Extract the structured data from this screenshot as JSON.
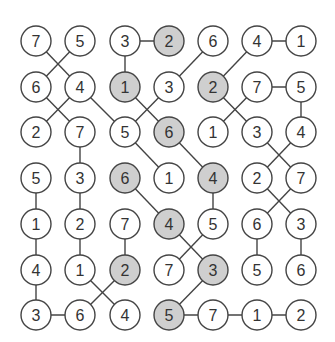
{
  "puzzle": {
    "cols": 7,
    "rows": 7,
    "colX": [
      36,
      80,
      125,
      169,
      213,
      257,
      301
    ],
    "rowY": [
      41,
      87,
      132,
      178,
      224,
      270,
      315
    ],
    "radius": 15,
    "colors": {
      "stroke": "#444444",
      "fill": "#ffffff",
      "shaded": "#cfcfcf",
      "text": "#333333"
    },
    "values": [
      [
        7,
        5,
        3,
        2,
        6,
        4,
        1
      ],
      [
        6,
        4,
        1,
        3,
        2,
        7,
        5
      ],
      [
        2,
        7,
        5,
        6,
        1,
        3,
        4
      ],
      [
        5,
        3,
        6,
        1,
        4,
        2,
        7
      ],
      [
        1,
        2,
        7,
        4,
        5,
        6,
        3
      ],
      [
        4,
        1,
        2,
        7,
        3,
        5,
        6
      ],
      [
        3,
        6,
        4,
        5,
        7,
        1,
        2
      ]
    ],
    "shaded": [
      [
        0,
        3
      ],
      [
        1,
        2
      ],
      [
        1,
        4
      ],
      [
        2,
        3
      ],
      [
        3,
        2
      ],
      [
        3,
        4
      ],
      [
        4,
        3
      ],
      [
        5,
        2
      ],
      [
        5,
        4
      ],
      [
        6,
        3
      ]
    ],
    "edges": [
      [
        [
          0,
          0
        ],
        [
          1,
          1
        ]
      ],
      [
        [
          0,
          1
        ],
        [
          1,
          0
        ]
      ],
      [
        [
          0,
          2
        ],
        [
          0,
          3
        ]
      ],
      [
        [
          0,
          2
        ],
        [
          1,
          2
        ]
      ],
      [
        [
          0,
          4
        ],
        [
          1,
          3
        ]
      ],
      [
        [
          0,
          5
        ],
        [
          1,
          4
        ]
      ],
      [
        [
          0,
          5
        ],
        [
          0,
          6
        ]
      ],
      [
        [
          1,
          0
        ],
        [
          2,
          1
        ]
      ],
      [
        [
          1,
          1
        ],
        [
          2,
          0
        ]
      ],
      [
        [
          1,
          1
        ],
        [
          2,
          2
        ]
      ],
      [
        [
          1,
          2
        ],
        [
          2,
          3
        ]
      ],
      [
        [
          1,
          3
        ],
        [
          2,
          2
        ]
      ],
      [
        [
          1,
          4
        ],
        [
          2,
          5
        ]
      ],
      [
        [
          1,
          5
        ],
        [
          2,
          4
        ]
      ],
      [
        [
          1,
          5
        ],
        [
          1,
          6
        ]
      ],
      [
        [
          1,
          6
        ],
        [
          2,
          6
        ]
      ],
      [
        [
          2,
          1
        ],
        [
          3,
          1
        ]
      ],
      [
        [
          2,
          2
        ],
        [
          3,
          3
        ]
      ],
      [
        [
          2,
          3
        ],
        [
          3,
          4
        ]
      ],
      [
        [
          2,
          5
        ],
        [
          3,
          6
        ]
      ],
      [
        [
          2,
          6
        ],
        [
          3,
          5
        ]
      ],
      [
        [
          3,
          0
        ],
        [
          4,
          0
        ]
      ],
      [
        [
          3,
          1
        ],
        [
          4,
          1
        ]
      ],
      [
        [
          3,
          2
        ],
        [
          4,
          3
        ]
      ],
      [
        [
          3,
          4
        ],
        [
          4,
          4
        ]
      ],
      [
        [
          3,
          5
        ],
        [
          4,
          6
        ]
      ],
      [
        [
          3,
          6
        ],
        [
          4,
          5
        ]
      ],
      [
        [
          4,
          0
        ],
        [
          5,
          0
        ]
      ],
      [
        [
          4,
          1
        ],
        [
          5,
          1
        ]
      ],
      [
        [
          4,
          2
        ],
        [
          5,
          2
        ]
      ],
      [
        [
          4,
          3
        ],
        [
          5,
          4
        ]
      ],
      [
        [
          4,
          4
        ],
        [
          5,
          3
        ]
      ],
      [
        [
          4,
          5
        ],
        [
          5,
          5
        ]
      ],
      [
        [
          4,
          6
        ],
        [
          5,
          6
        ]
      ],
      [
        [
          5,
          0
        ],
        [
          6,
          0
        ]
      ],
      [
        [
          5,
          1
        ],
        [
          6,
          2
        ]
      ],
      [
        [
          5,
          2
        ],
        [
          6,
          1
        ]
      ],
      [
        [
          5,
          4
        ],
        [
          6,
          3
        ]
      ],
      [
        [
          6,
          0
        ],
        [
          6,
          1
        ]
      ],
      [
        [
          6,
          3
        ],
        [
          6,
          4
        ]
      ],
      [
        [
          6,
          4
        ],
        [
          6,
          5
        ]
      ],
      [
        [
          6,
          5
        ],
        [
          6,
          6
        ]
      ]
    ]
  }
}
